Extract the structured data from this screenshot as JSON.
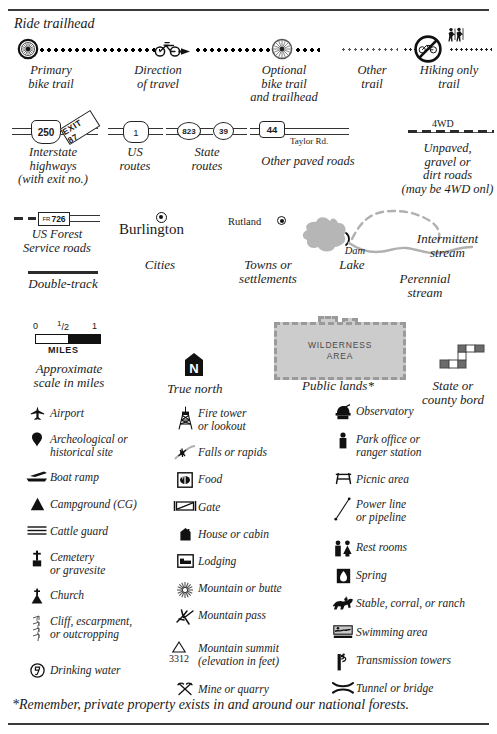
{
  "header": {
    "ride_trailhead_label": "Ride trailhead"
  },
  "trails": [
    {
      "name": "primary-bike-trail",
      "label_line1": "Primary",
      "label_line2": "bike trail"
    },
    {
      "name": "direction-of-travel",
      "label_line1": "Direction",
      "label_line2": "of travel"
    },
    {
      "name": "optional-bike-trail",
      "label_line1": "Optional",
      "label_line2": "bike trail",
      "label_line3": "and trailhead"
    },
    {
      "name": "other-trail",
      "label_line1": "Other",
      "label_line2": "trail"
    },
    {
      "name": "hiking-only-trail",
      "label_line1": "Hiking only",
      "label_line2": "trail"
    }
  ],
  "roads": {
    "interstate": {
      "shield_number": "250",
      "exit_text": "EXIT 87",
      "label_line1": "Interstate",
      "label_line2": "highways",
      "label_note": "(with exit no.)"
    },
    "us_routes": {
      "shield_number": "1",
      "label_line1": "US",
      "label_line2": "routes"
    },
    "state_routes": {
      "shield_a": "823",
      "shield_b": "39",
      "label_line1": "State",
      "label_line2": "routes"
    },
    "other_paved": {
      "shield_number": "44",
      "road_name": "Taylor Rd.",
      "label": "Other paved roads"
    },
    "unpaved": {
      "badge": "4WD",
      "label_line1": "Unpaved,",
      "label_line2": "gravel or",
      "label_line3": "dirt roads",
      "label_note": "(may be 4WD onl)"
    },
    "forest_service": {
      "prefix": "FR",
      "number": "726",
      "label_line1": "US Forest",
      "label_line2": "Service roads"
    },
    "double_track": {
      "label": "Double-track"
    }
  },
  "places": {
    "city": {
      "name": "Burlington",
      "label": "Cities"
    },
    "town": {
      "name": "Rutland",
      "label_line1": "Towns or",
      "label_line2": "settlements"
    }
  },
  "water": {
    "lake_label": "Lake",
    "dam_label": "Dam",
    "intermittent_line1": "Intermittent",
    "intermittent_line2": "stream",
    "perennial_line1": "Perennial",
    "perennial_line2": "stream"
  },
  "scale": {
    "tick_0": "0",
    "tick_half": "1/2",
    "tick_half_num": "1",
    "tick_half_den": "2",
    "tick_1": "1",
    "units": "MILES",
    "label_line1": "Approximate",
    "label_line2": "scale in miles"
  },
  "north": {
    "letter": "N",
    "label": "True north"
  },
  "public_lands": {
    "area_line1": "WILDERNESS",
    "area_line2": "AREA",
    "label": "Public lands*"
  },
  "border": {
    "label_line1": "State or",
    "label_line2": "county bord"
  },
  "symbols": {
    "column1": [
      {
        "icon": "airport-icon",
        "label": "Airport"
      },
      {
        "icon": "archeological-site-icon",
        "label": "Archeological or",
        "label2": "historical site"
      },
      {
        "icon": "boat-ramp-icon",
        "label": "Boat ramp"
      },
      {
        "icon": "campground-icon",
        "label": "Campground (CG)"
      },
      {
        "icon": "cattle-guard-icon",
        "label": "Cattle guard"
      },
      {
        "icon": "cemetery-icon",
        "label": "Cemetery",
        "label2": "or gravesite"
      },
      {
        "icon": "church-icon",
        "label": "Church"
      },
      {
        "icon": "cliff-icon",
        "label": "Cliff, escarpment,",
        "label2": "or outcropping"
      },
      {
        "icon": "drinking-water-icon",
        "label": "Drinking water"
      }
    ],
    "column2": [
      {
        "icon": "fire-tower-icon",
        "label": "Fire tower",
        "label2": "or lookout"
      },
      {
        "icon": "falls-rapids-icon",
        "label": "Falls or rapids"
      },
      {
        "icon": "food-icon",
        "label": "Food"
      },
      {
        "icon": "gate-icon",
        "label": "Gate"
      },
      {
        "icon": "house-cabin-icon",
        "label": "House or cabin"
      },
      {
        "icon": "lodging-icon",
        "label": "Lodging"
      },
      {
        "icon": "mountain-butte-icon",
        "label": "Mountain or butte"
      },
      {
        "icon": "mountain-pass-icon",
        "label": "Mountain pass"
      },
      {
        "icon": "mountain-summit-icon",
        "icon_value": "3312",
        "label": "Mountain summit",
        "label2": "(elevation in feet)"
      },
      {
        "icon": "mine-quarry-icon",
        "label": "Mine or quarry"
      }
    ],
    "column3": [
      {
        "icon": "observatory-icon",
        "label": "Observatory"
      },
      {
        "icon": "park-office-icon",
        "label": "Park office or",
        "label2": "ranger station"
      },
      {
        "icon": "picnic-area-icon",
        "label": "Picnic area"
      },
      {
        "icon": "power-line-icon",
        "label": "Power line",
        "label2": "or pipeline"
      },
      {
        "icon": "rest-rooms-icon",
        "label": "Rest rooms"
      },
      {
        "icon": "spring-icon",
        "label": "Spring"
      },
      {
        "icon": "stable-icon",
        "label": "Stable, corral, or ranch"
      },
      {
        "icon": "swimming-area-icon",
        "label": "Swimming area"
      },
      {
        "icon": "transmission-towers-icon",
        "label": "Transmission towers"
      },
      {
        "icon": "tunnel-bridge-icon",
        "label": "Tunnel or bridge"
      }
    ]
  },
  "footnote": {
    "text": "*Remember, private property exists in and around our national forests."
  },
  "colors": {
    "ink": "#1a1a1a",
    "water": "#b6b6b6",
    "public_land": "#cccccc",
    "public_land_border": "#9a9a9a"
  }
}
